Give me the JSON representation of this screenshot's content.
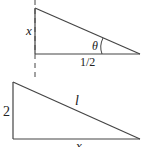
{
  "top_triangle": {
    "vertical_label": "x",
    "angle_label": "θ",
    "base_label": "1/2"
  },
  "bottom_triangle": {
    "vertical_label": "2",
    "hypotenuse_label": "l",
    "base_label": "x"
  },
  "colors": {
    "stroke": "#333333",
    "text": "#222222"
  }
}
